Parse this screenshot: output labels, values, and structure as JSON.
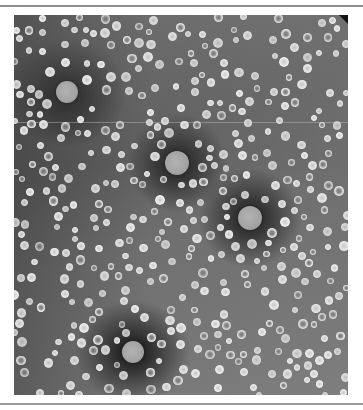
{
  "figure": {
    "description": "Negative-stain electron micrograph showing many small spherical particles and four larger spherical particles surrounded by dark stain halos",
    "large_particles": [
      {
        "x": 53,
        "y": 77,
        "r": 11
      },
      {
        "x": 163,
        "y": 148,
        "r": 12
      },
      {
        "x": 236,
        "y": 203,
        "r": 12
      },
      {
        "x": 119,
        "y": 337,
        "r": 11
      }
    ],
    "small_particle_seed": 7,
    "small_particle_count": 430,
    "small_particle_radius_range": [
      3,
      5
    ]
  }
}
